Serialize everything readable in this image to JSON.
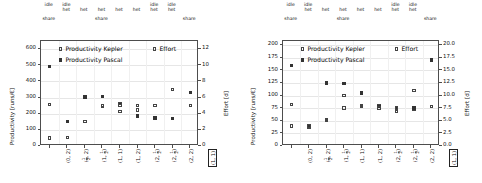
{
  "figure": {
    "panels": [
      {
        "id": "left",
        "name": "kepler-pascal-productivity-effort-panel-1",
        "top_labels": [
          {
            "lines": [
              "idle",
              "",
              "share"
            ]
          },
          {
            "lines": [
              "idle",
              "het",
              ""
            ]
          },
          {
            "lines": [
              "",
              "het",
              ""
            ]
          },
          {
            "lines": [
              "",
              "het",
              "share"
            ]
          },
          {
            "lines": [
              "",
              "het",
              ""
            ]
          },
          {
            "lines": [
              "",
              "het",
              ""
            ]
          },
          {
            "lines": [
              "idle",
              "het",
              ""
            ]
          },
          {
            "lines": [
              "idle",
              "het",
              ""
            ]
          },
          {
            "lines": [
              "",
              "",
              "share"
            ]
          }
        ],
        "chart_data": {
          "type": "scatter",
          "title": "",
          "xlabel": "",
          "ylabel": "Productivity [runs/€]",
          "y2label": "Effort [d]",
          "ylim": [
            0,
            650
          ],
          "yticks": [
            0,
            100,
            200,
            300,
            400,
            500,
            600
          ],
          "ytick_labels": [
            "0",
            "100",
            "200",
            "300",
            "400",
            "500",
            "600"
          ],
          "y2lim": [
            0,
            13
          ],
          "y2ticks": [
            0,
            2,
            4,
            6,
            8,
            10,
            12
          ],
          "y2tick_labels": [
            "0",
            "2",
            "4",
            "6",
            "8",
            "10",
            "12"
          ],
          "grid": true,
          "legend_position": "upper-center",
          "categories": [
            {
              "a": "0",
              "b": "2",
              "boxed": false
            },
            {
              "a": "1/2",
              "b": "2",
              "boxed": false
            },
            {
              "a": "1",
              "b": "1/2",
              "boxed": false
            },
            {
              "a": "1",
              "b": "1",
              "boxed": false
            },
            {
              "a": "1",
              "b": "2",
              "boxed": false
            },
            {
              "a": "2",
              "b": "1/2",
              "boxed": false
            },
            {
              "a": "2",
              "b": "1/2",
              "boxed": false
            },
            {
              "a": "2",
              "b": "2",
              "boxed": false
            },
            {
              "a": "1",
              "b": "1",
              "boxed": true
            }
          ],
          "series": [
            {
              "name": "Productivity Kepler",
              "marker": "open-square",
              "axis": "left",
              "values": [
                258,
                null,
                150,
                247,
                215,
                222,
                null,
                null,
                250
              ]
            },
            {
              "name": "Productivity Pascal",
              "marker": "filled-square",
              "axis": "left",
              "values": [
                492,
                150,
                303,
                305,
                262,
                186,
                173,
                171,
                332
              ]
            },
            {
              "name": "Effort",
              "marker": "open-square",
              "axis": "right",
              "values": [
                1.0,
                1.05,
                3.0,
                5.0,
                5.0,
                5.0,
                5.0,
                7.0,
                5.0
              ]
            }
          ],
          "effort_secondary_points": [
            null,
            null,
            null,
            null,
            5.3,
            null,
            null,
            null,
            null
          ]
        }
      },
      {
        "id": "right",
        "name": "kepler-pascal-productivity-effort-panel-2",
        "top_labels": [
          {
            "lines": [
              "idle",
              "",
              "share"
            ]
          },
          {
            "lines": [
              "idle",
              "het",
              ""
            ]
          },
          {
            "lines": [
              "",
              "het",
              ""
            ]
          },
          {
            "lines": [
              "",
              "het",
              "share"
            ]
          },
          {
            "lines": [
              "",
              "het",
              ""
            ]
          },
          {
            "lines": [
              "",
              "het",
              ""
            ]
          },
          {
            "lines": [
              "idle",
              "het",
              ""
            ]
          },
          {
            "lines": [
              "idle",
              "het",
              ""
            ]
          },
          {
            "lines": [
              "",
              "",
              "share"
            ]
          }
        ],
        "chart_data": {
          "type": "scatter",
          "title": "",
          "xlabel": "",
          "ylabel": "Productivity [runs/€]",
          "y2label": "Effort [d]",
          "ylim": [
            0,
            208
          ],
          "yticks": [
            0,
            25,
            50,
            75,
            100,
            125,
            150,
            175,
            200
          ],
          "ytick_labels": [
            "0",
            "25",
            "50",
            "75",
            "100",
            "125",
            "150",
            "175",
            "200"
          ],
          "y2lim": [
            0,
            20.8
          ],
          "y2ticks": [
            0.0,
            2.5,
            5.0,
            7.5,
            10.0,
            12.5,
            15.0,
            17.5,
            20.0
          ],
          "y2tick_labels": [
            "0.0",
            "2.5",
            "5.0",
            "7.5",
            "10.0",
            "12.5",
            "15.0",
            "17.5",
            "20.0"
          ],
          "grid": true,
          "legend_position": "upper-center",
          "categories": [
            {
              "a": "0",
              "b": "2",
              "boxed": false
            },
            {
              "a": "1/2",
              "b": "2",
              "boxed": false
            },
            {
              "a": "1",
              "b": "1/2",
              "boxed": false
            },
            {
              "a": "1",
              "b": "1",
              "boxed": false
            },
            {
              "a": "1",
              "b": "2",
              "boxed": false
            },
            {
              "a": "2",
              "b": "1/2",
              "boxed": false
            },
            {
              "a": "2",
              "b": "1/2",
              "boxed": false
            },
            {
              "a": "2",
              "b": "2",
              "boxed": false
            },
            {
              "a": "1",
              "b": "1",
              "boxed": true
            }
          ],
          "series": [
            {
              "name": "Productivity Kepler",
              "marker": "open-square",
              "axis": "left",
              "values": [
                82,
                38,
                52,
                75,
                78,
                80,
                68,
                73,
                78
              ]
            },
            {
              "name": "Productivity Pascal",
              "marker": "filled-square",
              "axis": "left",
              "values": [
                160,
                40,
                125,
                124,
                105,
                78,
                74,
                75,
                170
              ]
            },
            {
              "name": "Effort",
              "marker": "open-square",
              "axis": "right",
              "values": [
                4.0,
                4.0,
                5.0,
                10.0,
                8.0,
                7.5,
                7.5,
                11.0,
                7.8
              ]
            }
          ]
        }
      }
    ],
    "legend": {
      "kepler_label": "Productivity Kepler",
      "pascal_label": "Productivity Pascal",
      "effort_label": "Effort"
    }
  }
}
